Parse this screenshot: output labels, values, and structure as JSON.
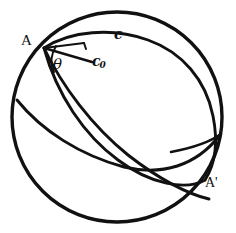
{
  "figure": {
    "kind": "geometry-diagram",
    "background_color": "#ffffff",
    "stroke_color": "#111111",
    "canvas": {
      "width": 236,
      "height": 233
    },
    "sphere": {
      "name": "sphere-outline",
      "center_x": 117,
      "center_y": 117,
      "radius": 105,
      "stroke_width": 3.2
    },
    "points": [
      {
        "id": "A",
        "label": "A",
        "x": 44,
        "y": 48
      },
      {
        "id": "Aprime",
        "label": "A'",
        "x": 205,
        "y": 180
      }
    ],
    "curves": [
      {
        "id": "great-circle-c",
        "label": "c",
        "label_x": 120,
        "label_y": 36,
        "stroke_width": 2.8
      },
      {
        "id": "great-circle-secondary",
        "label": "",
        "stroke_width": 2.8
      },
      {
        "id": "great-circle-through-A",
        "label": "",
        "stroke_width": 2.8
      }
    ],
    "segments": [
      {
        "id": "c0-segment",
        "label": "c₀",
        "label_text": "c",
        "label_sub": "0",
        "x1": 44,
        "y1": 48,
        "x2": 92,
        "y2": 62,
        "stroke_width": 2.4
      }
    ],
    "angles": [
      {
        "id": "theta-angle",
        "label": "θ",
        "vertex_x": 44,
        "vertex_y": 48,
        "label_x": 58,
        "label_y": 66
      }
    ],
    "labels": {
      "point_a": "A",
      "point_a_prime": "A'",
      "curve_c": "c",
      "segment_c0_base": "c",
      "segment_c0_sub": "0",
      "angle_theta": "θ"
    }
  }
}
